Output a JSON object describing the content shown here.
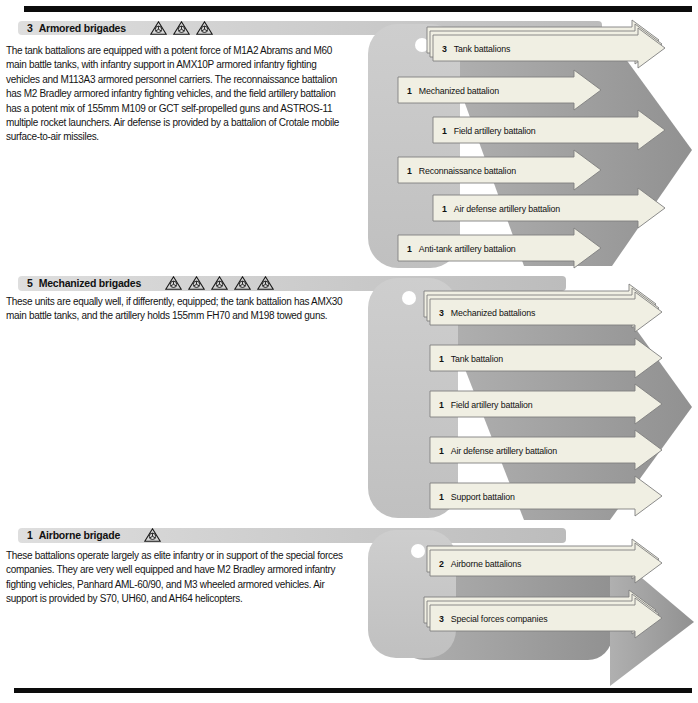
{
  "palette": {
    "unit_arrow_fill": "#f0efe3",
    "unit_arrow_stroke": "#7f7f7f",
    "big_arrow_gray": "#9a9a9a",
    "band_gray": "#cccccc",
    "rule_black": "#0c0c0c"
  },
  "sections": [
    {
      "count": "3",
      "title": "Armored brigades",
      "brigade_icons": 3,
      "description": "The tank battalions are equipped with a potent force of M1A2 Abrams and M60 main battle tanks, with infantry support in AMX10P armored infantry fighting vehicles and M113A3 armored personnel carriers. The reconnaissance battalion has M2 Bradley armored infantry fighting vehicles, and the field artillery battalion has a potent mix of 155mm M109 or GCT self-propelled guns and ASTROS-11 multiple rocket launchers. Air defense is provided by a battalion of Crotale mobile surface-to-air missiles.",
      "units": [
        {
          "count": "3",
          "label": "Tank battalions"
        },
        {
          "count": "1",
          "label": "Mechanized battalion"
        },
        {
          "count": "1",
          "label": "Field artillery battalion"
        },
        {
          "count": "1",
          "label": "Reconnaissance battalion"
        },
        {
          "count": "1",
          "label": "Air defense artillery battalion"
        },
        {
          "count": "1",
          "label": "Anti-tank artillery battalion"
        }
      ]
    },
    {
      "count": "5",
      "title": "Mechanized brigades",
      "brigade_icons": 5,
      "description": "These units are equally well, if differently, equipped; the tank battalion has AMX30 main battle tanks, and the artillery holds 155mm FH70 and M198 towed guns.",
      "units": [
        {
          "count": "3",
          "label": "Mechanized battalions"
        },
        {
          "count": "1",
          "label": "Tank battalion"
        },
        {
          "count": "1",
          "label": "Field artillery battalion"
        },
        {
          "count": "1",
          "label": "Air defense artillery battalion"
        },
        {
          "count": "1",
          "label": "Support battalion"
        }
      ]
    },
    {
      "count": "1",
      "title": "Airborne brigade",
      "brigade_icons": 1,
      "description": "These battalions operate largely as elite infantry or in support of the special forces companies. They are very well equipped and have M2 Bradley armored infantry fighting vehicles, Panhard AML-60/90, and M3 wheeled armored vehicles. Air support is provided by S70, UH60, and AH64 helicopters.",
      "units": [
        {
          "count": "2",
          "label": "Airborne battalions"
        },
        {
          "count": "3",
          "label": "Special forces companies"
        }
      ]
    }
  ]
}
